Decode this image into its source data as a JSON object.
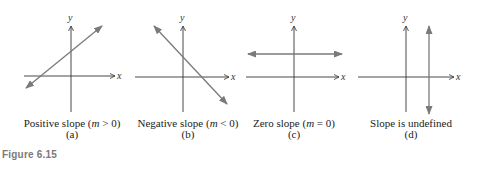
{
  "figure": {
    "label": "Figure 6.15",
    "colors": {
      "axis": "#333333",
      "line": "#7a7a7a",
      "caption": "#222222",
      "figure_label": "#7a7a7a"
    },
    "axis_labels": {
      "x": "x",
      "y": "y"
    },
    "panels": [
      {
        "id": "a",
        "caption_prefix": "Positive slope (",
        "caption_var": "m",
        "caption_suffix": " > 0)",
        "tag": "(a)",
        "line_type": "positive-slope"
      },
      {
        "id": "b",
        "caption_prefix": "Negative slope (",
        "caption_var": "m",
        "caption_suffix": " < 0)",
        "tag": "(b)",
        "line_type": "negative-slope"
      },
      {
        "id": "c",
        "caption_prefix": "Zero slope (",
        "caption_var": "m",
        "caption_suffix": " = 0)",
        "tag": "(c)",
        "line_type": "horizontal"
      },
      {
        "id": "d",
        "caption_prefix": "Slope is undefined",
        "caption_var": "",
        "caption_suffix": "",
        "tag": "(d)",
        "line_type": "vertical"
      }
    ]
  }
}
